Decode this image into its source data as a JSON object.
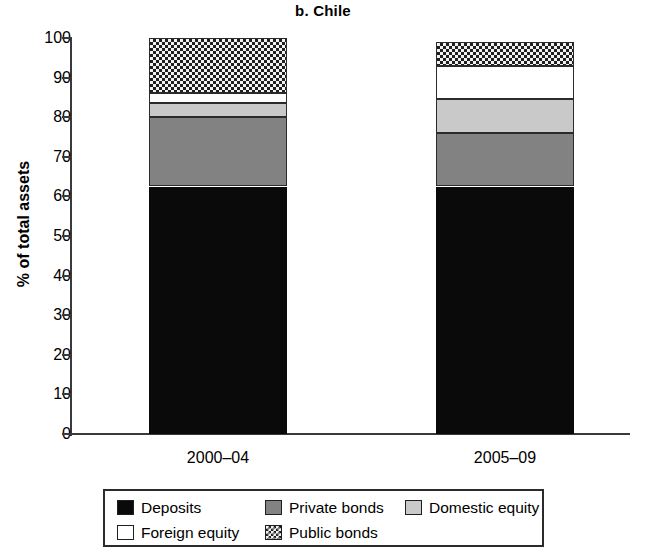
{
  "chart_data": {
    "type": "bar",
    "title": "b. Chile",
    "xlabel": "",
    "ylabel": "% of total assets",
    "categories": [
      "2000–04",
      "2005–09"
    ],
    "ylim": [
      0,
      100
    ],
    "yticks": [
      0,
      10,
      20,
      30,
      40,
      50,
      60,
      70,
      80,
      90,
      100
    ],
    "ytick_labels": [
      "0",
      "10",
      "20",
      "30",
      "40",
      "50",
      "60",
      "70",
      "80",
      "90",
      "100"
    ],
    "grid": false,
    "stacked": true,
    "legend_position": "bottom",
    "series": [
      {
        "name": "Deposits",
        "values": [
          62.5,
          62.5
        ],
        "color": "#0a0a0a",
        "pattern": "solid"
      },
      {
        "name": "Private bonds",
        "values": [
          17.5,
          13.5
        ],
        "color": "#828282",
        "pattern": "solid"
      },
      {
        "name": "Domestic equity",
        "values": [
          3.5,
          8.5
        ],
        "color": "#c9c9c9",
        "pattern": "solid"
      },
      {
        "name": "Foreign equity",
        "values": [
          2.5,
          8.5
        ],
        "color": "#ffffff",
        "pattern": "solid"
      },
      {
        "name": "Public bonds",
        "values": [
          14.0,
          6.0
        ],
        "color": "#f2f2f2",
        "pattern": "checkerboard"
      }
    ],
    "cumulative_tops": [
      [
        62.5,
        80.0,
        83.5,
        86.0,
        100.0
      ],
      [
        62.5,
        76.0,
        84.5,
        93.0,
        99.0
      ]
    ],
    "totals": [
      100.0,
      99.0
    ]
  },
  "legend": {
    "rows": [
      [
        {
          "label": "Deposits",
          "key": "deposits"
        },
        {
          "label": "Private bonds",
          "key": "private"
        },
        {
          "label": "Domestic equity",
          "key": "domestic"
        }
      ],
      [
        {
          "label": "Foreign equity",
          "key": "foreign"
        },
        {
          "label": "Public bonds",
          "key": "public"
        }
      ]
    ]
  }
}
